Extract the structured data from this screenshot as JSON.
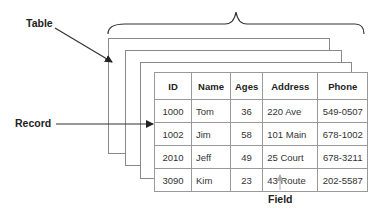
{
  "labels": {
    "table": "Table",
    "record": "Record",
    "field": "Field"
  },
  "table": {
    "headers": [
      "ID",
      "Name",
      "Ages",
      "Address",
      "Phone"
    ],
    "rows": [
      [
        "1000",
        "Tom",
        "36",
        "220 Ave",
        "549-0507"
      ],
      [
        "1002",
        "Jim",
        "58",
        "101 Main",
        "678-1002"
      ],
      [
        "2010",
        "Jeff",
        "49",
        "25 Court",
        "678-3211"
      ],
      [
        "3090",
        "Kim",
        "23",
        "43 Route",
        "202-5587"
      ]
    ]
  }
}
